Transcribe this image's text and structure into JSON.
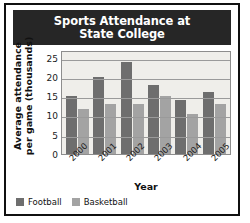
{
  "chart_data": {
    "type": "bar",
    "title": "Sports Attendance at State College",
    "title_line1": "Sports Attendance at",
    "title_line2": "State College",
    "xlabel": "Year",
    "ylabel": "Average attendance per game (thousands)",
    "ylabel_line1": "Average attendance",
    "ylabel_line2": "per game (thousands)",
    "categories": [
      "2000",
      "2001",
      "2002",
      "2003",
      "2004",
      "2005"
    ],
    "series": [
      {
        "name": "Football",
        "color": "#6e6e6e",
        "values": [
          15,
          20,
          24,
          18,
          14,
          16
        ]
      },
      {
        "name": "Basketball",
        "color": "#a3a3a3",
        "values": [
          11.7,
          13,
          13,
          15,
          10.5,
          13
        ]
      }
    ],
    "ylim": [
      0,
      27
    ],
    "yticks": [
      0,
      5,
      10,
      15,
      20,
      25
    ],
    "grid": true,
    "legend_position": "bottom-left"
  },
  "colors": {
    "frame": "#101010",
    "title_bar": "#262626",
    "title_text": "#ffffff",
    "plot_background": "#efeeea",
    "gridline": "#9a9a9a",
    "football": "#6e6e6e",
    "basketball": "#a3a3a3"
  }
}
